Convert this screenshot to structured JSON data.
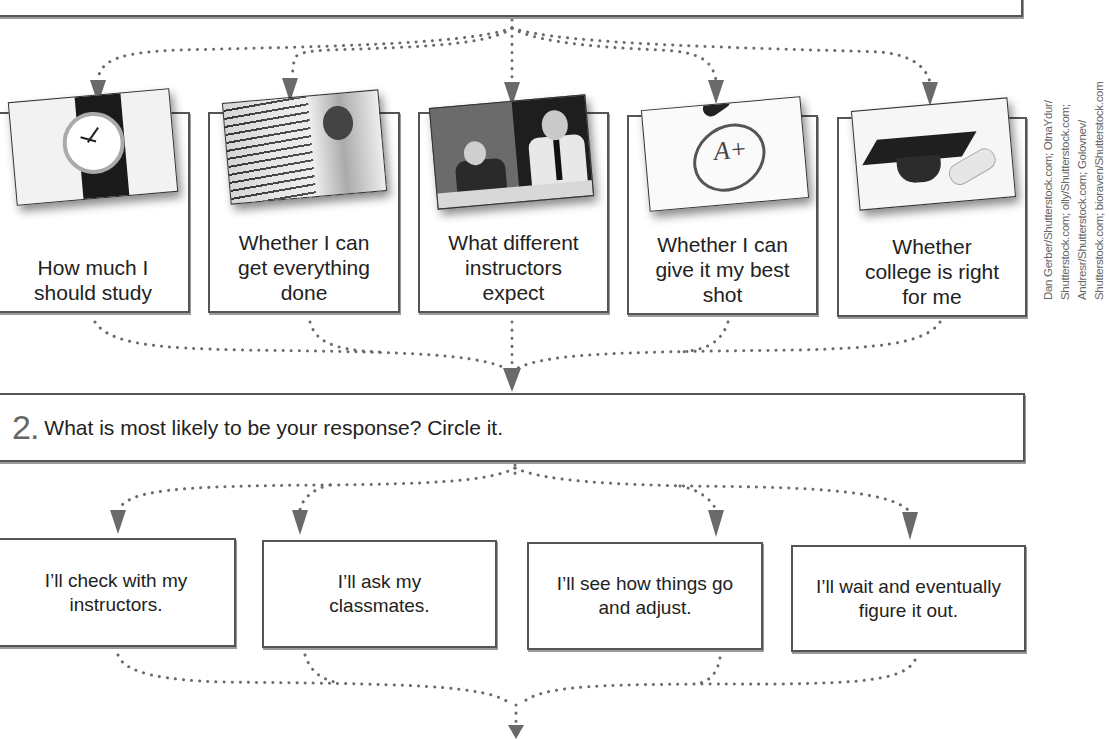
{
  "top_box": {
    "text": ""
  },
  "concerns": [
    {
      "label": "How much I should study",
      "photo": "wristwatch-photo"
    },
    {
      "label": "Whether I can get everything done",
      "photo": "stack-of-papers-photo"
    },
    {
      "label": "What different instructors expect",
      "photo": "instructors-photo"
    },
    {
      "label": "Whether I can give it my best shot",
      "photo": "a-plus-grade-photo"
    },
    {
      "label": "Whether college is right for me",
      "photo": "graduation-cap-photo"
    }
  ],
  "question2": {
    "number": "2.",
    "text": "What is most likely to be your response? Circle it."
  },
  "responses": [
    {
      "label": "I’ll check with my instructors."
    },
    {
      "label": "I’ll ask my classmates."
    },
    {
      "label": "I’ll see how things go and adjust."
    },
    {
      "label": "I’ll wait and eventually figure it out."
    }
  ],
  "credit": {
    "lines": [
      "Dan Gerber/Shutterstock.com; OtnaYdur/",
      "Shutterstock.com; olly/Shutterstock.com;",
      "Andresr/Shutterstock.com; Golovnev/",
      "Shutterstock.com; bioraven/Shutterstock.com"
    ]
  },
  "colors": {
    "border": "#555555",
    "connector": "#6a6a6a",
    "text": "#222222",
    "number": "#666666"
  }
}
